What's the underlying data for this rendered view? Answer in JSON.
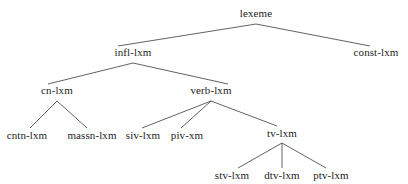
{
  "diagram": {
    "type": "tree-hierarchy",
    "background_color": "#ffffff",
    "edge_color": "#3a3a3a",
    "text_color": "#1c1c1c",
    "edge_width": 0.8,
    "nodes": [
      {
        "id": "lexeme",
        "label": "lexeme",
        "x": 256,
        "y": 13,
        "level": 0
      },
      {
        "id": "infl-lxm",
        "label": "infl-lxm",
        "x": 133,
        "y": 52,
        "level": 1
      },
      {
        "id": "const-lxm",
        "label": "const-lxm",
        "x": 376,
        "y": 52,
        "level": 1
      },
      {
        "id": "cn-lxm",
        "label": "cn-lxm",
        "x": 57,
        "y": 90,
        "level": 2
      },
      {
        "id": "verb-lxm",
        "label": "verb-lxm",
        "x": 211,
        "y": 90,
        "level": 2
      },
      {
        "id": "cntn-lxm",
        "label": "cntn-lxm",
        "x": 27,
        "y": 135,
        "level": 3
      },
      {
        "id": "massn-lxm",
        "label": "massn-lxm",
        "x": 92,
        "y": 135,
        "level": 3
      },
      {
        "id": "siv-lxm",
        "label": "siv-lxm",
        "x": 143,
        "y": 135,
        "level": 3
      },
      {
        "id": "piv-xm",
        "label": "piv-xm",
        "x": 187,
        "y": 135,
        "level": 3
      },
      {
        "id": "tv-lxm",
        "label": "tv-lxm",
        "x": 282,
        "y": 133,
        "level": 3
      },
      {
        "id": "stv-lxm",
        "label": "stv-lxm",
        "x": 232,
        "y": 175,
        "level": 4
      },
      {
        "id": "dtv-lxm",
        "label": "dtv-lxm",
        "x": 282,
        "y": 175,
        "level": 4
      },
      {
        "id": "ptv-lxm",
        "label": "ptv-lxm",
        "x": 331,
        "y": 175,
        "level": 4
      }
    ],
    "edges": [
      {
        "from": "lexeme",
        "to": "infl-lxm",
        "x1": 256,
        "y1": 24,
        "x2": 118,
        "y2": 46
      },
      {
        "from": "lexeme",
        "to": "const-lxm",
        "x1": 256,
        "y1": 24,
        "x2": 370,
        "y2": 46
      },
      {
        "from": "infl-lxm",
        "to": "cn-lxm",
        "x1": 133,
        "y1": 63,
        "x2": 48,
        "y2": 84
      },
      {
        "from": "infl-lxm",
        "to": "verb-lxm",
        "x1": 133,
        "y1": 63,
        "x2": 228,
        "y2": 84
      },
      {
        "from": "cn-lxm",
        "to": "cntn-lxm",
        "x1": 57,
        "y1": 101,
        "x2": 30,
        "y2": 128
      },
      {
        "from": "cn-lxm",
        "to": "massn-lxm",
        "x1": 57,
        "y1": 101,
        "x2": 87,
        "y2": 128
      },
      {
        "from": "verb-lxm",
        "to": "siv-lxm",
        "x1": 211,
        "y1": 101,
        "x2": 142,
        "y2": 128
      },
      {
        "from": "verb-lxm",
        "to": "piv-xm",
        "x1": 211,
        "y1": 101,
        "x2": 181,
        "y2": 128
      },
      {
        "from": "verb-lxm",
        "to": "tv-lxm",
        "x1": 211,
        "y1": 101,
        "x2": 277,
        "y2": 126
      },
      {
        "from": "tv-lxm",
        "to": "stv-lxm",
        "x1": 282,
        "y1": 143,
        "x2": 238,
        "y2": 168
      },
      {
        "from": "tv-lxm",
        "to": "dtv-lxm",
        "x1": 282,
        "y1": 143,
        "x2": 282,
        "y2": 168
      },
      {
        "from": "tv-lxm",
        "to": "ptv-lxm",
        "x1": 282,
        "y1": 143,
        "x2": 326,
        "y2": 168
      }
    ]
  }
}
